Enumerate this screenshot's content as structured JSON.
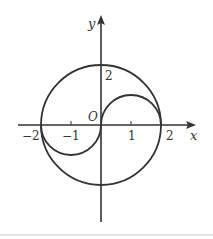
{
  "diagram": {
    "type": "coordinate-plane-curves",
    "axes": {
      "x_label": "x",
      "y_label": "y",
      "origin_label": "O"
    },
    "tick_labels": {
      "x": [
        "−2",
        "−1",
        "1",
        "2"
      ],
      "y": [
        "2"
      ]
    },
    "curves": [
      {
        "name": "big-circle",
        "description": "circle centered at origin, radius 2"
      },
      {
        "name": "upper-right-semicircle",
        "description": "upper semicircle centered at (1,0), radius 1"
      },
      {
        "name": "lower-left-semicircle",
        "description": "lower semicircle centered at (-1,0), radius 1"
      }
    ],
    "colors": {
      "stroke": "#333333",
      "background": "#ffffff",
      "bottom_rule": "#cccccc"
    }
  }
}
